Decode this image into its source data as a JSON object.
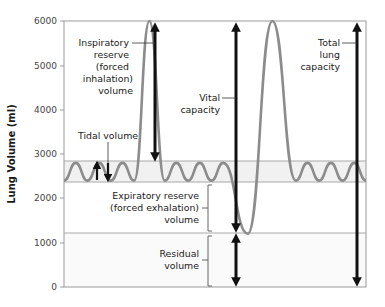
{
  "chart_data": {
    "type": "line",
    "title": "",
    "xlabel": "",
    "ylabel": "Lung Volume (ml)",
    "ylim": [
      0,
      6000
    ],
    "yticks": [
      0,
      1000,
      2000,
      3000,
      4000,
      5000,
      6000
    ],
    "grid": false,
    "reference_lines_ml": [
      2800,
      2400,
      1200
    ],
    "series": [
      {
        "name": "Lung volume trace",
        "color": "#8c8c8c",
        "description": "Tidal breathing oscillating 2400–2800 ml; forced inhalation to 6000 ml; tidal breathing; forced exhalation to 1200 ml; forced inhalation to 6000 ml; tidal breathing",
        "points": [
          {
            "x": 0,
            "y": 2400
          },
          {
            "x": 1,
            "y": 2800
          },
          {
            "x": 2,
            "y": 2400
          },
          {
            "x": 3,
            "y": 2800
          },
          {
            "x": 4,
            "y": 2400
          },
          {
            "x": 5,
            "y": 2800
          },
          {
            "x": 6,
            "y": 2400
          },
          {
            "x": 7.3,
            "y": 6000
          },
          {
            "x": 8.6,
            "y": 2400
          },
          {
            "x": 9.6,
            "y": 2800
          },
          {
            "x": 10.6,
            "y": 2400
          },
          {
            "x": 11.6,
            "y": 2800
          },
          {
            "x": 12.6,
            "y": 2400
          },
          {
            "x": 13.6,
            "y": 2800
          },
          {
            "x": 15.7,
            "y": 1200
          },
          {
            "x": 17.8,
            "y": 6000
          },
          {
            "x": 19.8,
            "y": 2400
          },
          {
            "x": 20.8,
            "y": 2800
          },
          {
            "x": 21.8,
            "y": 2400
          },
          {
            "x": 22.8,
            "y": 2800
          },
          {
            "x": 23.8,
            "y": 2400
          },
          {
            "x": 24.8,
            "y": 2800
          },
          {
            "x": 25.8,
            "y": 2400
          }
        ]
      }
    ],
    "annotations": [
      {
        "label": "Tidal volume",
        "range_ml": [
          2400,
          2800
        ]
      },
      {
        "label": "Inspiratory reserve (forced inhalation) volume",
        "range_ml": [
          2800,
          6000
        ]
      },
      {
        "label": "Expiratory reserve (forced exhalation) volume",
        "range_ml": [
          1200,
          2400
        ]
      },
      {
        "label": "Residual volume",
        "range_ml": [
          0,
          1200
        ]
      },
      {
        "label": "Vital capacity",
        "range_ml": [
          1200,
          6000
        ]
      },
      {
        "label": "Total lung capacity",
        "range_ml": [
          0,
          6000
        ]
      }
    ]
  },
  "axis": {
    "ylabel": "Lung Volume (ml)",
    "ticks": [
      "0",
      "1000",
      "2000",
      "3000",
      "4000",
      "5000",
      "6000"
    ]
  },
  "labels": {
    "inspiratory": [
      "Inspiratory",
      "reserve",
      "(forced",
      "inhalation)",
      "volume"
    ],
    "tidal": "Tidal volume",
    "vital": [
      "Vital",
      "capacity"
    ],
    "total": [
      "Total",
      "lung",
      "capacity"
    ],
    "expiratory": [
      "Expiratory reserve",
      "(forced exhalation)",
      "volume"
    ],
    "residual": [
      "Residual",
      "volume"
    ]
  },
  "colors": {
    "trace": "#8c8c8c",
    "frame": "#9a9a9a",
    "band": "#f1f1f1",
    "arrow": "#111111",
    "text": "#1a1a1a"
  }
}
